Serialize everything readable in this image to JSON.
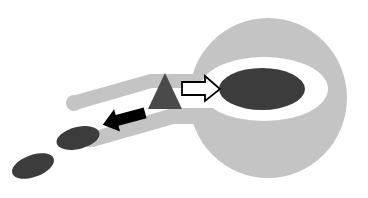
{
  "canvas": {
    "width": 368,
    "height": 198,
    "background_color": "#FFFFFF"
  },
  "palette": {
    "light_gray": "#C4C4C4",
    "mid_gray": "#BEBEBE",
    "dark_gray": "#3C3C3C",
    "triangle_gray": "#4A4A4A",
    "white": "#FFFFFF",
    "black": "#000000",
    "outline": "#000000"
  },
  "diagram": {
    "title": "",
    "type": "schematic-transport-diagram",
    "shapes": {
      "outer_body": {
        "name": "outer-body-disc",
        "fill": "#C4C4C4",
        "cx": 268,
        "cy": 98,
        "rx": 79,
        "ry": 80
      },
      "inner_white_ellipse": {
        "name": "inner-white-ellipse",
        "fill": "#FFFFFF",
        "cx": 264,
        "cy": 89,
        "rx": 64,
        "ry": 32
      },
      "core_ellipse": {
        "name": "core-dark-ellipse",
        "fill": "#3C3C3C",
        "cx": 262,
        "cy": 89,
        "rx": 43,
        "ry": 21
      },
      "upper_tube_band": {
        "name": "upper-tube-band",
        "fill": "#C4C4C4",
        "thickness": 14
      },
      "lower_tube_band": {
        "name": "lower-tube-band",
        "fill": "#C4C4C4",
        "thickness": 15
      },
      "triangle": {
        "name": "gate-triangle",
        "fill": "#4A4A4A",
        "apex_x": 165,
        "apex_y": 73,
        "base_left_x": 148,
        "base_right_x": 182,
        "base_y": 109
      },
      "particles": [
        {
          "name": "particle-ellipse-large",
          "fill": "#3C3C3C",
          "cx": 78,
          "cy": 138,
          "rx": 22,
          "ry": 11,
          "rotation_deg": -14
        },
        {
          "name": "particle-ellipse-small",
          "fill": "#3C3C3C",
          "cx": 33,
          "cy": 166,
          "rx": 22,
          "ry": 11,
          "rotation_deg": -20
        }
      ],
      "inward_arrow": {
        "name": "inward-white-arrow",
        "fill": "#FFFFFF",
        "stroke": "#000000",
        "direction": "right",
        "from_x": 182,
        "to_x": 220,
        "y": 89
      },
      "outward_arrow": {
        "name": "outward-black-arrow",
        "fill": "#000000",
        "direction": "left",
        "from_x": 146,
        "to_x": 102,
        "y": 119
      }
    }
  },
  "labels": {
    "figure_caption": "",
    "annotations": []
  }
}
